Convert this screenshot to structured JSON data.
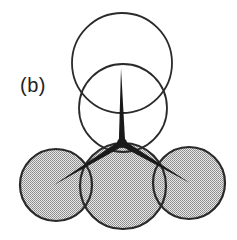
{
  "figure": {
    "panel_label": "(b)",
    "stroke_color": "#2a2a2a",
    "fill_color": "#c8c8c8",
    "open_circles": [
      {
        "name": "top-circle",
        "cx": 122,
        "cy": 63,
        "r": 50
      },
      {
        "name": "middle-circle",
        "cx": 123,
        "cy": 108,
        "r": 44
      }
    ],
    "shaded_circles": [
      {
        "name": "left-circle",
        "cx": 56,
        "cy": 185,
        "r": 36
      },
      {
        "name": "center-circle",
        "cx": 123,
        "cy": 186,
        "r": 43
      },
      {
        "name": "right-circle",
        "cx": 189,
        "cy": 183,
        "r": 36
      }
    ],
    "junction": {
      "x": 122,
      "y": 143
    },
    "spokes": [
      {
        "name": "vertical-spoke",
        "x": 121,
        "y": 68
      },
      {
        "name": "left-spoke",
        "x": 54,
        "y": 185
      },
      {
        "name": "right-spoke",
        "x": 190,
        "y": 183
      }
    ]
  }
}
